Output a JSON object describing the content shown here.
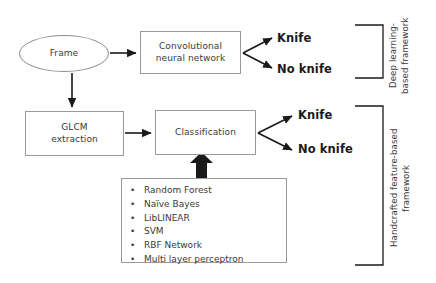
{
  "diagram": {
    "background_color": "#ffffff",
    "stroke_color": "#9a9a9a",
    "text_color": "#3a3a3a",
    "arrow_color": "#1a1a1a"
  },
  "nodes": {
    "frame": "Frame",
    "cnn": "Convolutional\nneural network",
    "glcm": "GLCM\nextraction",
    "classification": "Classification"
  },
  "outcomes": {
    "deep_knife": "Knife",
    "deep_no_knife": "No knife",
    "handcrafted_knife": "Knife",
    "handcrafted_no_knife": "No knife"
  },
  "classifier_list": {
    "bullet": "•",
    "items": [
      "Random Forest",
      "Naïve Bayes",
      "LibLINEAR",
      "SVM",
      "RBF Network",
      "Multi layer perceptron"
    ]
  },
  "frameworks": {
    "deep": "Deep learning-\nbased framework",
    "handcrafted": "Handcrafted feature-based\nframework"
  }
}
